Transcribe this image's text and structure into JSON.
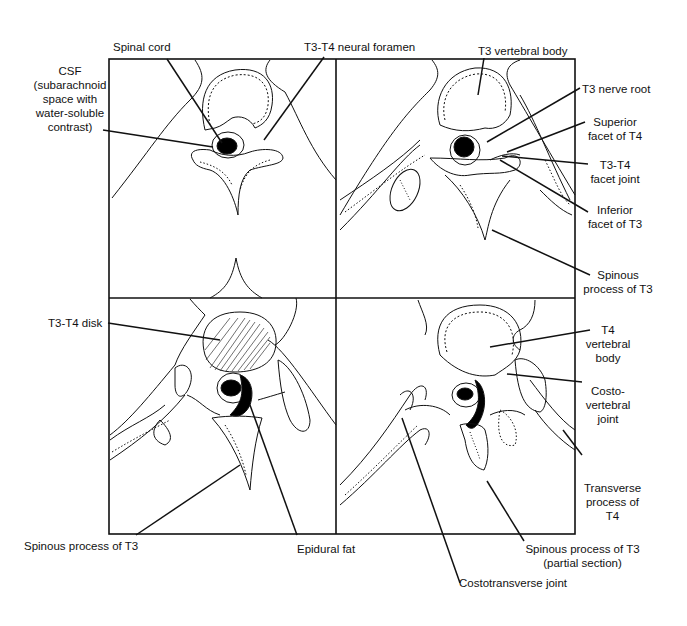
{
  "figure": {
    "panels": [
      {
        "id": "top-left",
        "level": "T3-T4 neural foramen level"
      },
      {
        "id": "top-right",
        "level": "T3-T4 facet joint level"
      },
      {
        "id": "bottom-left",
        "level": "T3-T4 disk level"
      },
      {
        "id": "bottom-right",
        "level": "T4 vertebral body level"
      }
    ],
    "labels": {
      "spinal_cord": "Spinal cord",
      "neural_foramen": "T3-T4 neural foramen",
      "csf_l1": "CSF",
      "csf_l2": "(subarachnoid",
      "csf_l3": "space with",
      "csf_l4": "water-soluble",
      "csf_l5": "contrast)",
      "t3_vertebral_body": "T3 vertebral body",
      "t3_nerve_root": "T3 nerve root",
      "superior_facet_l1": "Superior",
      "superior_facet_l2": "facet of T4",
      "facet_joint_l1": "T3-T4",
      "facet_joint_l2": "facet joint",
      "inferior_facet_l1": "Inferior",
      "inferior_facet_l2": "facet of T3",
      "spinous_tr_l1": "Spinous",
      "spinous_tr_l2": "process of T3",
      "t3_t4_disk": "T3-T4 disk",
      "t4_body_l1": "T4",
      "t4_body_l2": "vertebral",
      "t4_body_l3": "body",
      "costovertebral_l1": "Costo-",
      "costovertebral_l2": "vertebral",
      "costovertebral_l3": "joint",
      "transverse_l1": "Transverse",
      "transverse_l2": "process of",
      "transverse_l3": "T4",
      "spinous_bl": "Spinous process of T3",
      "epidural_fat": "Epidural fat",
      "spinous_br_l1": "Spinous process of T3",
      "spinous_br_l2": "(partial section)",
      "costotransverse": "Costotransverse joint"
    }
  }
}
